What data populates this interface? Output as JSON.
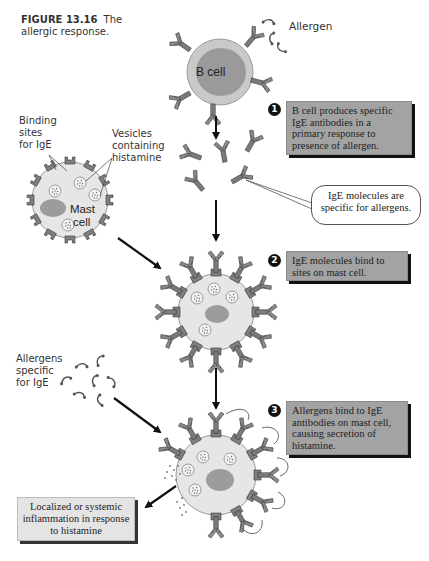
{
  "figure": {
    "number": "FIGURE 13.16",
    "title": "The allergic response."
  },
  "labels": {
    "b_cell": "B cell",
    "allergen": "Allergen",
    "binding_sites": [
      "Binding",
      "sites",
      "for IgE"
    ],
    "vesicles": [
      "Vesicles",
      "containing",
      "histamine"
    ],
    "mast_cell": [
      "Mast",
      "cell"
    ],
    "allergens_specific": [
      "Allergens",
      "specific",
      "for IgE"
    ]
  },
  "steps": [
    {
      "number": "1",
      "text": "B cell produces specific IgE antibodies in a primary response to presence of allergen."
    },
    {
      "number": "2",
      "text": "IgE molecules bind to sites on mast cell."
    },
    {
      "number": "3",
      "text": "Allergens bind to IgE antibodies on mast cell, causing secretion of histamine."
    }
  ],
  "callout": {
    "text": "IgE molecules are specific for allergens."
  },
  "outcome": {
    "text": "Localized or systemic inflammation in response to histamine"
  },
  "colors": {
    "cell_outer": "#c9c9c9",
    "cell_inner": "#9a9a9a",
    "mast_cell_body": "#e6e6e6",
    "antibody": "#777777",
    "step_box": "#a3a3a3",
    "outcome_box": "#e4e4e4",
    "arrow": "#111111"
  }
}
